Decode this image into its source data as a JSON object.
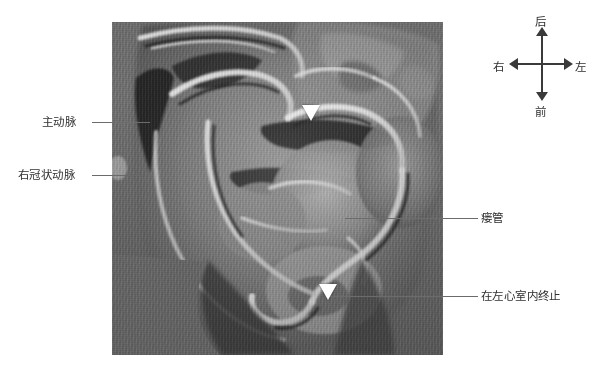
{
  "figure": {
    "modality": "cardiac-ct-volume-rendering",
    "alt": "心脏CT容积重建图像"
  },
  "annotations": {
    "aorta": {
      "label": "主动脉",
      "side": "left"
    },
    "right_coronary_artery": {
      "label": "右冠状动脉",
      "side": "left"
    },
    "fistula": {
      "label": "瘘管",
      "side": "right"
    },
    "termination": {
      "label": "在左心室内终止",
      "side": "right"
    }
  },
  "markers": [
    {
      "name": "fistula-origin-arrow",
      "glyph": "arrow-down"
    },
    {
      "name": "fistula-termination-arrow",
      "glyph": "arrow-down"
    }
  ],
  "compass": {
    "posterior": "后",
    "anterior": "前",
    "right": "右",
    "left": "左"
  },
  "colors": {
    "label_text": "#2f2f2f",
    "leader_line": "#6b6b6b",
    "compass_axis": "#3a3a3a",
    "marker": "#ffffff",
    "background": "#ffffff"
  }
}
